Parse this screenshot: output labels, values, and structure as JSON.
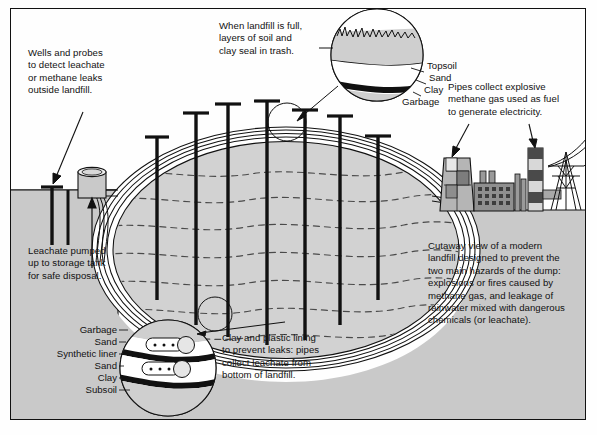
{
  "diagram": {
    "title": "Cutaway view of a modern landfill",
    "colors": {
      "ground": "#c9c9c9",
      "garbage_fill": "#d2d2d2",
      "ink": "#111111",
      "liner_white": "#ffffff",
      "plant_gray": "#9a9a9a",
      "plant_dark": "#555555"
    }
  },
  "callouts": {
    "wells": "Wells and probes\nto detect leachate\nor methane leaks\noutside landfill.",
    "cap_seal": "When landfill is full,\nlayers of soil and\nclay seal in trash.",
    "methane": "Pipes collect explosive\nmethane gas used as fuel\nto generate electricity.",
    "leachate_pump": "Leachate pumped\nup to storage tank\nfor safe disposal.",
    "liner": "Clay and plastic lining\nto prevent leaks: pipes\ncollect leachate from\nbottom of landfill.",
    "overview": "Cutaway view of a modern\nlandfill designed to prevent the\ntwo main hazards of the dump:\nexplosions or fires caused by\nmethane gas, and leakage of\nrainwater mixed with dangerous\nchemicals (or leachate)."
  },
  "top_detail": {
    "name": "cap-layers-detail",
    "layers": [
      {
        "label": "Topsoil"
      },
      {
        "label": "Sand"
      },
      {
        "label": "Clay"
      },
      {
        "label": "Garbage"
      }
    ]
  },
  "bottom_detail": {
    "name": "liner-layers-detail",
    "layers": [
      {
        "label": "Garbage"
      },
      {
        "label": "Sand"
      },
      {
        "label": "Synthetic liner"
      },
      {
        "label": "Sand"
      },
      {
        "label": "Clay"
      },
      {
        "label": "Subsoil"
      }
    ]
  },
  "structures": {
    "gas_pipe_count": 7,
    "storage_tank": "leachate-storage-tank",
    "probe_count": 2,
    "power_plant": "methane-fuelled-power-plant",
    "pylon": "electricity-transmission-tower"
  }
}
